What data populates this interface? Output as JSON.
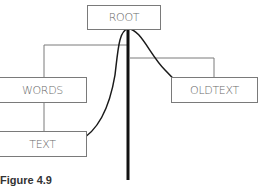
{
  "diagram": {
    "nodes": {
      "root": "ROOT",
      "words": "WORDS",
      "oldtext": "OLDTEXT",
      "text": "TEXT"
    },
    "caption": "Figure 4.9"
  },
  "colors": {
    "box_border": "#7a7a7a",
    "box_text": "#6a6a6a",
    "arrow": "#1a1a1a",
    "connector": "#7a7a7a"
  }
}
